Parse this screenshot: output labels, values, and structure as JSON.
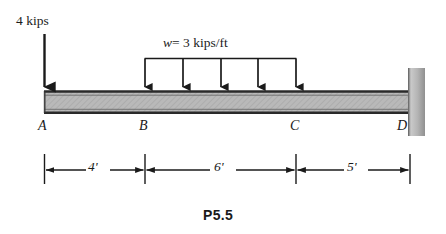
{
  "figure": {
    "caption": "P5.5",
    "kind": "beam-loading-diagram"
  },
  "loads": {
    "point_load": {
      "label": "4 kips",
      "magnitude": 4,
      "unit": "kips",
      "at_node": "A",
      "direction": "down"
    },
    "distributed_load": {
      "label_w": "w",
      "label_eq": "= 3 kips/ft",
      "label_full": "w = 3 kips/ft",
      "magnitude": 3,
      "unit": "kips/ft",
      "from_node": "B",
      "to_node": "C",
      "direction": "down",
      "arrow_count": 5
    }
  },
  "nodes": [
    {
      "label": "A",
      "x_ft": 0
    },
    {
      "label": "B",
      "x_ft": 4
    },
    {
      "label": "C",
      "x_ft": 10
    },
    {
      "label": "D",
      "x_ft": 15
    }
  ],
  "dimensions": [
    {
      "label": "4'",
      "value": 4,
      "unit": "ft",
      "from": "A",
      "to": "B"
    },
    {
      "label": "6'",
      "value": 6,
      "unit": "ft",
      "from": "B",
      "to": "C"
    },
    {
      "label": "5'",
      "value": 5,
      "unit": "ft",
      "from": "C",
      "to": "D"
    }
  ],
  "support": {
    "type": "fixed-wall",
    "at_node": "D",
    "side": "right"
  },
  "colors": {
    "ink": "#1a1a1a",
    "beam_fill": "#b9b9b9",
    "beam_edge": "#2a2a2a",
    "wall_light": "#d8d8d8",
    "wall_dark": "#8f8f8f",
    "page": "#ffffff"
  }
}
